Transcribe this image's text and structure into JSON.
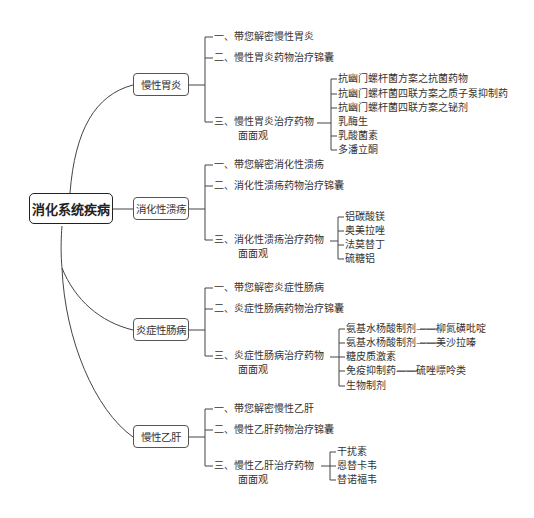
{
  "root": {
    "label": "消化系统疾病"
  },
  "categories": [
    {
      "label": "慢性胃炎",
      "items": [
        {
          "label": "一、带您解密慢性胃炎"
        },
        {
          "label": "二、慢性胃炎药物治疗锦囊"
        },
        {
          "label": "三、慢性胃炎治疗药物",
          "label2": "面面观",
          "subitems": [
            "抗幽门螺杆菌方案之抗菌药物",
            "抗幽门螺杆菌四联方案之质子泵抑制药",
            "抗幽门螺杆菌四联方案之铋剂",
            "乳酶生",
            "乳酸菌素",
            "多潘立酮"
          ]
        }
      ]
    },
    {
      "label": "消化性溃疡",
      "items": [
        {
          "label": "一、带您解密消化性溃疡"
        },
        {
          "label": "二、消化性溃疡药物治疗锦囊"
        },
        {
          "label": "三、消化性溃疡治疗药物",
          "label2": "面面观",
          "subitems": [
            "铝碳酸镁",
            "奥美拉唑",
            "法莫替丁",
            "硫糖铝"
          ]
        }
      ]
    },
    {
      "label": "炎症性肠病",
      "items": [
        {
          "label": "一、带您解密炎症性肠病"
        },
        {
          "label": "二、炎症性肠病药物治疗锦囊"
        },
        {
          "label": "三、炎症性肠病治疗药物",
          "label2": "面面观",
          "subitems": [
            "氨基水杨酸制剂——柳氮磺吡啶",
            "氨基水杨酸制剂——美沙拉嗪",
            "糖皮质激素",
            "免疫抑制药——硫唑嘌呤类",
            "生物制剂"
          ]
        }
      ]
    },
    {
      "label": "慢性乙肝",
      "items": [
        {
          "label": "一、带您解密慢性乙肝"
        },
        {
          "label": "二、慢性乙肝药物治疗锦囊"
        },
        {
          "label": "三、慢性乙肝治疗药物",
          "label2": "面面观",
          "subitems": [
            "干扰素",
            "恩替卡韦",
            "替诺福韦"
          ]
        }
      ]
    }
  ],
  "colors": {
    "line": "#444444",
    "text": "#333333",
    "background": "#ffffff"
  }
}
